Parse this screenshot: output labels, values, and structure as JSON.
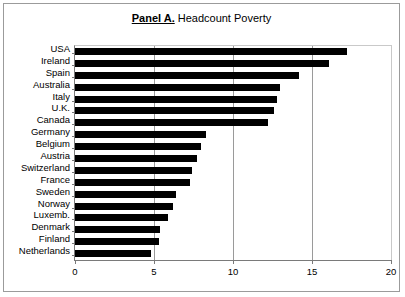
{
  "figure": {
    "title_bold": "Panel A.",
    "title_rest": "Headcount Poverty",
    "border_color": "#9b9b9b",
    "bar_color": "#000000"
  },
  "chart_data": {
    "type": "bar",
    "orientation": "horizontal",
    "xlabel": "",
    "ylabel": "",
    "xlim": [
      0,
      20
    ],
    "xticks": [
      0,
      5,
      10,
      15,
      20
    ],
    "xtick_labels": [
      "0",
      "5",
      "10",
      "15",
      "20"
    ],
    "grid": true,
    "grid_axis": "x",
    "legend": false,
    "categories": [
      "USA",
      "Ireland",
      "Spain",
      "Australia",
      "Italy",
      "U.K.",
      "Canada",
      "Germany",
      "Belgium",
      "Austria",
      "Switzerland",
      "France",
      "Sweden",
      "Norway",
      "Luxemb.",
      "Denmark",
      "Finland",
      "Netherlands"
    ],
    "values": [
      17.2,
      16.1,
      14.2,
      13.0,
      12.8,
      12.6,
      12.2,
      8.3,
      8.0,
      7.7,
      7.4,
      7.3,
      6.4,
      6.2,
      5.9,
      5.4,
      5.3,
      4.8
    ]
  }
}
